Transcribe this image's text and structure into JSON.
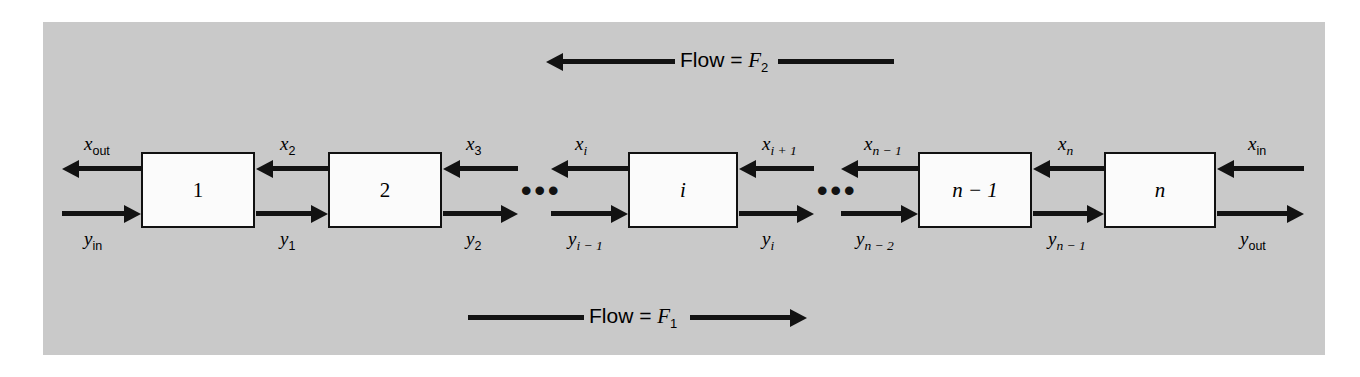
{
  "figure": {
    "type": "countercurrent-cascade-diagram",
    "panel_color": "#c9c9c9",
    "background_color": "#ffffff",
    "line_color": "#121212",
    "box_fill": "#fbfbfb"
  },
  "flows": {
    "top": {
      "label": "Flow = ",
      "symbol": "F",
      "subscript": "2",
      "direction": "left",
      "full_text": "Flow = F2"
    },
    "bottom": {
      "label": "Flow = ",
      "symbol": "F",
      "subscript": "1",
      "direction": "right",
      "full_text": "Flow = F1"
    }
  },
  "stages": [
    {
      "id": "stage-1",
      "name": "1",
      "italic": false
    },
    {
      "id": "stage-2",
      "name": "2",
      "italic": false
    },
    {
      "id": "stage-i",
      "name": "i",
      "italic": true
    },
    {
      "id": "stage-n-1",
      "name": "n − 1",
      "italic": true
    },
    {
      "id": "stage-n",
      "name": "n",
      "italic": true
    }
  ],
  "ellipses": [
    {
      "id": "ellipsis-left",
      "text": "•••"
    },
    {
      "id": "ellipsis-right",
      "text": "•••"
    }
  ],
  "stream_labels": {
    "x_out": {
      "base": "x",
      "sub": "out",
      "sub_italic": false
    },
    "x_2": {
      "base": "x",
      "sub": "2",
      "sub_italic": false
    },
    "x_3": {
      "base": "x",
      "sub": "3",
      "sub_italic": false
    },
    "x_i": {
      "base": "x",
      "sub": "i",
      "sub_italic": true
    },
    "x_i1": {
      "base": "x",
      "sub": "i + 1",
      "sub_italic": true
    },
    "x_nm1": {
      "base": "x",
      "sub": "n − 1",
      "sub_italic": true
    },
    "x_n": {
      "base": "x",
      "sub": "n",
      "sub_italic": true
    },
    "x_in": {
      "base": "x",
      "sub": "in",
      "sub_italic": false
    },
    "y_in": {
      "base": "y",
      "sub": "in",
      "sub_italic": false
    },
    "y_1": {
      "base": "y",
      "sub": "1",
      "sub_italic": false
    },
    "y_2": {
      "base": "y",
      "sub": "2",
      "sub_italic": false
    },
    "y_im1": {
      "base": "y",
      "sub": "i − 1",
      "sub_italic": true
    },
    "y_i": {
      "base": "y",
      "sub": "i",
      "sub_italic": true
    },
    "y_nm2": {
      "base": "y",
      "sub": "n − 2",
      "sub_italic": true
    },
    "y_nm1": {
      "base": "y",
      "sub": "n − 1",
      "sub_italic": true
    },
    "y_out": {
      "base": "y",
      "sub": "out",
      "sub_italic": false
    }
  }
}
